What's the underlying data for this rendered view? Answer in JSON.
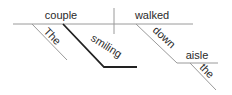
{
  "diagram": {
    "type": "sentence-diagram",
    "sentence_words": [
      "The",
      "smiling",
      "couple",
      "walked",
      "down",
      "the",
      "aisle"
    ],
    "subject": "couple",
    "verb": "walked",
    "subject_modifiers": [
      "The",
      "smiling"
    ],
    "verb_modifier_preposition": "down",
    "prepositional_object": "aisle",
    "object_modifiers": [
      "the"
    ],
    "colors": {
      "line_light": "#9a9a9a",
      "line_dark": "#222222",
      "text": "#2a2a2a",
      "background": "#ffffff"
    }
  }
}
